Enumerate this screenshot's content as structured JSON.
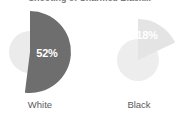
{
  "chart_data": {
    "type": "pie",
    "title": "Shooting of Unarmed Black...",
    "xlabel": "",
    "ylabel": "",
    "grid": false,
    "legend": "none",
    "value_suffix": "%",
    "categories": [
      "White",
      "Black"
    ],
    "values": [
      52,
      18
    ],
    "series": [
      {
        "name": "Share",
        "values": [
          52,
          18
        ]
      }
    ],
    "charts": [
      {
        "category": "White",
        "value": 52,
        "value_label": "52%",
        "slice_color": "#6e6e6e",
        "track_color": "#ebebeb",
        "label_color": "#ffffff"
      },
      {
        "category": "Black",
        "value": 18,
        "value_label": "18%",
        "slice_color": "#e4e4e4",
        "track_color": "#ededed",
        "label_color": "#ffffff"
      }
    ]
  },
  "colors": {
    "background": "#ffffff",
    "title": "#7a7a7a",
    "category_label": "#5b5b5b",
    "slice_dark": "#6e6e6e",
    "slice_light": "#e4e4e4",
    "track": "#ebebeb",
    "value_text": "#ffffff"
  }
}
